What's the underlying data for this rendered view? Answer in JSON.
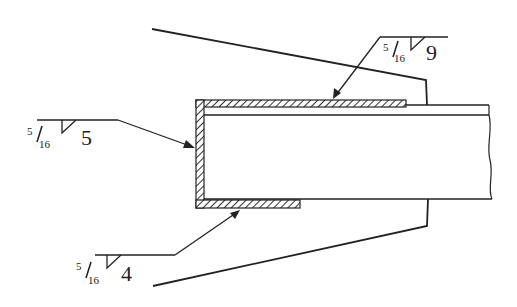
{
  "diagram": {
    "type": "welding-detail",
    "colors": {
      "line": "#222222",
      "background": "#ffffff",
      "hatch": "#333333"
    },
    "welds": [
      {
        "id": "top",
        "size_numerator": "5",
        "size_denominator": "16",
        "symbol": "fillet",
        "length": "9"
      },
      {
        "id": "end",
        "size_numerator": "5",
        "size_denominator": "16",
        "symbol": "fillet",
        "length": "5"
      },
      {
        "id": "bottom",
        "size_numerator": "5",
        "size_denominator": "16",
        "symbol": "fillet",
        "length": "4"
      }
    ]
  }
}
